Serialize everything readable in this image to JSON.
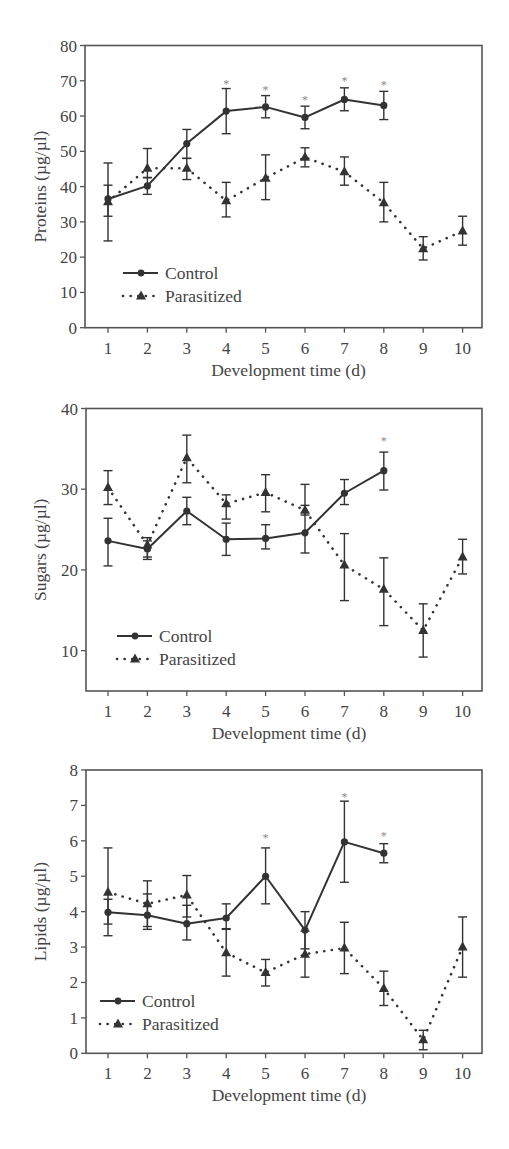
{
  "colors": {
    "frame": "#555555",
    "line": "#333333",
    "text": "#444444",
    "asterisk": "#8a8a8a",
    "background": "#ffffff"
  },
  "legend": {
    "control_label": "Control",
    "parasitized_label": "Parasitized"
  },
  "chart_data": [
    {
      "type": "line",
      "title": "",
      "xlabel": "Development time (d)",
      "ylabel": "Proteins (µg/µl)",
      "x": [
        1,
        2,
        3,
        4,
        5,
        6,
        7,
        8,
        9,
        10
      ],
      "xticks": [
        "1",
        "2",
        "3",
        "4",
        "5",
        "6",
        "7",
        "8",
        "9",
        "10"
      ],
      "ylim": [
        0,
        80
      ],
      "yticks": [
        0,
        10,
        20,
        30,
        40,
        50,
        60,
        70,
        80
      ],
      "grid": false,
      "legend_position": "lower left",
      "series": [
        {
          "name": "Control",
          "style": "solid",
          "marker": "circle",
          "values": [
            36.5,
            40.2,
            52.2,
            61.4,
            62.6,
            59.6,
            64.7,
            63.0,
            null,
            null
          ],
          "err_low": [
            24.6,
            37.8,
            48.0,
            55.0,
            59.5,
            56.4,
            61.5,
            59.0,
            null,
            null
          ],
          "err_high": [
            46.7,
            42.5,
            56.2,
            67.8,
            65.8,
            62.8,
            68.0,
            67.0,
            null,
            null
          ]
        },
        {
          "name": "Parasitized",
          "style": "dotted",
          "marker": "triangle",
          "values": [
            35.7,
            45.2,
            45.2,
            36.0,
            42.4,
            48.3,
            44.2,
            35.4,
            22.4,
            27.4
          ],
          "err_low": [
            31.6,
            42.6,
            42.0,
            31.4,
            36.3,
            45.6,
            40.4,
            30.0,
            19.2,
            23.4
          ],
          "err_high": [
            40.4,
            50.8,
            48.0,
            41.2,
            49.0,
            51.0,
            48.4,
            41.2,
            25.8,
            31.6
          ]
        }
      ],
      "annotations": [
        {
          "text": "*",
          "x": 4,
          "y": 70.2
        },
        {
          "text": "*",
          "x": 5,
          "y": 68.6
        },
        {
          "text": "*",
          "x": 6,
          "y": 65.8
        },
        {
          "text": "*",
          "x": 7,
          "y": 71.0
        },
        {
          "text": "*",
          "x": 8,
          "y": 69.9
        }
      ]
    },
    {
      "type": "line",
      "title": "",
      "xlabel": "Development time (d)",
      "ylabel": "Sugars (µg/µl)",
      "x": [
        1,
        2,
        3,
        4,
        5,
        6,
        7,
        8,
        9,
        10
      ],
      "xticks": [
        "1",
        "2",
        "3",
        "4",
        "5",
        "6",
        "7",
        "8",
        "9",
        "10"
      ],
      "ylim": [
        5,
        40
      ],
      "yticks": [
        10,
        20,
        30,
        40
      ],
      "grid": false,
      "legend_position": "lower left",
      "series": [
        {
          "name": "Control",
          "style": "solid",
          "marker": "circle",
          "values": [
            23.6,
            22.6,
            27.3,
            23.8,
            23.9,
            24.6,
            29.5,
            32.3,
            null,
            null
          ],
          "err_low": [
            20.5,
            21.3,
            25.6,
            21.8,
            22.6,
            22.1,
            28.1,
            29.9,
            null,
            null
          ],
          "err_high": [
            26.4,
            24.0,
            29.0,
            25.8,
            25.6,
            30.6,
            31.2,
            34.6,
            null,
            null
          ]
        },
        {
          "name": "Parasitized",
          "style": "dotted",
          "marker": "triangle",
          "values": [
            30.2,
            23.1,
            33.9,
            28.2,
            29.6,
            27.4,
            20.6,
            17.6,
            12.5,
            21.6
          ],
          "err_low": [
            28.1,
            21.6,
            30.8,
            26.3,
            27.2,
            26.8,
            16.2,
            13.1,
            9.2,
            19.5
          ],
          "err_high": [
            32.3,
            23.6,
            36.7,
            29.3,
            31.8,
            28.0,
            24.5,
            21.5,
            15.8,
            23.8
          ]
        }
      ],
      "annotations": [
        {
          "text": "*",
          "x": 8,
          "y": 36.5
        }
      ]
    },
    {
      "type": "line",
      "title": "",
      "xlabel": "Development time (d)",
      "ylabel": "Lipids (µg/µl)",
      "x": [
        1,
        2,
        3,
        4,
        5,
        6,
        7,
        8,
        9,
        10
      ],
      "xticks": [
        "1",
        "2",
        "3",
        "4",
        "5",
        "6",
        "7",
        "8",
        "9",
        "10"
      ],
      "ylim": [
        0,
        8
      ],
      "yticks": [
        0,
        1,
        2,
        3,
        4,
        5,
        6,
        7,
        8
      ],
      "grid": false,
      "legend_position": "lower left",
      "series": [
        {
          "name": "Control",
          "style": "solid",
          "marker": "circle",
          "values": [
            3.98,
            3.9,
            3.66,
            3.82,
            5.0,
            3.48,
            5.97,
            5.65,
            null,
            null
          ],
          "err_low": [
            3.65,
            3.58,
            3.2,
            3.5,
            4.22,
            2.95,
            4.83,
            5.38,
            null,
            null
          ],
          "err_high": [
            4.35,
            4.5,
            4.18,
            4.22,
            5.8,
            4.0,
            7.12,
            5.92,
            null,
            null
          ]
        },
        {
          "name": "Parasitized",
          "style": "dotted",
          "marker": "triangle",
          "values": [
            4.55,
            4.22,
            4.47,
            2.84,
            2.28,
            2.8,
            2.97,
            1.83,
            0.38,
            3.0
          ],
          "err_low": [
            3.32,
            3.5,
            3.85,
            2.18,
            1.9,
            2.15,
            2.25,
            1.35,
            0.1,
            2.15
          ],
          "err_high": [
            5.8,
            4.87,
            5.02,
            3.52,
            2.65,
            3.45,
            3.7,
            2.32,
            0.65,
            3.85
          ]
        }
      ],
      "annotations": [
        {
          "text": "*",
          "x": 5,
          "y": 6.2
        },
        {
          "text": "*",
          "x": 7,
          "y": 7.35
        },
        {
          "text": "*",
          "x": 8,
          "y": 6.25
        }
      ]
    }
  ],
  "layout": {
    "panels": [
      {
        "frame_left": 85,
        "frame_right": 482,
        "frame_top": 45.5,
        "frame_bottom": 327.7,
        "x_first": 108,
        "x_step": 39.4,
        "legend_x": 123,
        "legend_y": 273
      },
      {
        "frame_left": 86,
        "frame_right": 482,
        "frame_top": 408.5,
        "frame_bottom": 691,
        "x_first": 108,
        "x_step": 39.4,
        "legend_x": 117,
        "legend_y": 636
      },
      {
        "frame_left": 86,
        "frame_right": 482,
        "frame_top": 770,
        "frame_bottom": 1053.3,
        "x_first": 108,
        "x_step": 39.4,
        "legend_x": 100,
        "legend_y": 1001
      }
    ]
  }
}
